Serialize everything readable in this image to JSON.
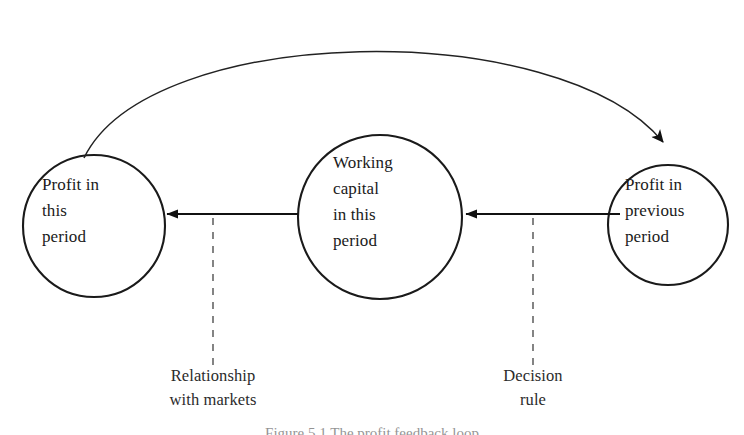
{
  "figure": {
    "type": "cycle-diagram",
    "background_color": "#ffffff",
    "stroke_color": "#1a1a1a",
    "caption": "Figure 5.1   The profit feedback loop"
  },
  "nodes": [
    {
      "id": "profit-this-period",
      "label": "Profit in\nthis\nperiod",
      "cx": 94,
      "cy": 226,
      "r": 71
    },
    {
      "id": "working-capital-this-period",
      "label": "Working\ncapital\nin this\nperiod",
      "cx": 380,
      "cy": 217,
      "r": 82
    },
    {
      "id": "profit-previous-period",
      "label": "Profit in\nprevious\nperiod",
      "cx": 668,
      "cy": 225,
      "r": 60
    }
  ],
  "edges": [
    {
      "id": "edge-working-capital-to-profit-this",
      "from": "working-capital-this-period",
      "to": "profit-this-period",
      "style": "solid",
      "arrowhead": "end"
    },
    {
      "id": "edge-profit-previous-to-working-capital",
      "from": "profit-previous-period",
      "to": "working-capital-this-period",
      "style": "solid",
      "arrowhead": "end"
    },
    {
      "id": "edge-profit-this-to-profit-previous",
      "from": "profit-this-period",
      "to": "profit-previous-period",
      "style": "curved",
      "arrowhead": "end"
    }
  ],
  "annotations": [
    {
      "id": "annotation-relationship-with-markets",
      "label": "Relationship\nwith markets",
      "attached_to": "edge-working-capital-to-profit-this",
      "connector": "dashed"
    },
    {
      "id": "annotation-decision-rule",
      "label": "Decision\nrule",
      "attached_to": "edge-profit-previous-to-working-capital",
      "connector": "dashed"
    }
  ]
}
